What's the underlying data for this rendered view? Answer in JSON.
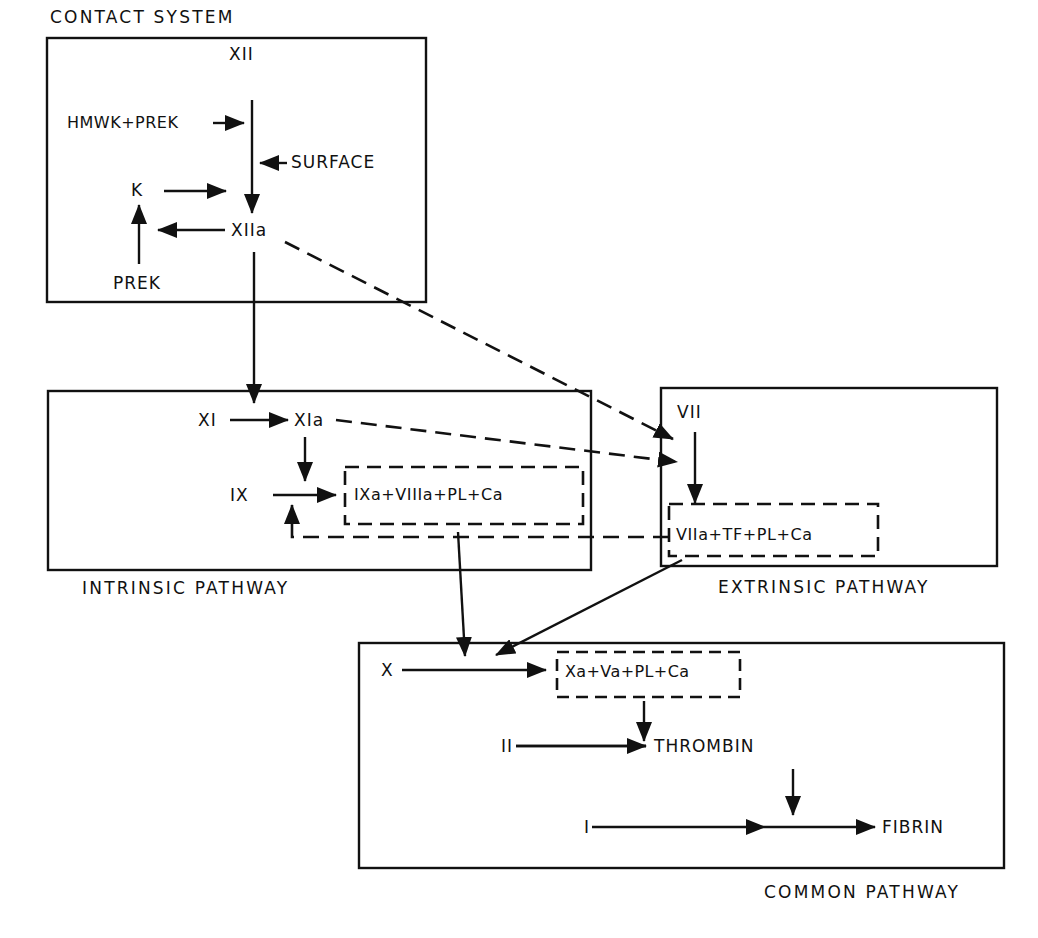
{
  "diagram": {
    "type": "coagulation-cascade",
    "colors": {
      "ink": "#111111",
      "background": "#ffffff"
    },
    "regions": {
      "contact": {
        "title": "CONTACT SYSTEM"
      },
      "intrinsic": {
        "title": "INTRINSIC PATHWAY"
      },
      "extrinsic": {
        "title": "EXTRINSIC PATHWAY"
      },
      "common": {
        "title": "COMMON PATHWAY"
      }
    },
    "nodes": {
      "xii": "XII",
      "hmwk_prek": "HMWK+PREK",
      "surface": "SURFACE",
      "k": "K",
      "xiia": "XIIa",
      "prek": "PREK",
      "xi": "XI",
      "xia": "XIa",
      "ix": "IX",
      "ixa_complex": "IXa+VIIIa+PL+Ca",
      "vii": "VII",
      "viia_complex": "VIIa+TF+PL+Ca",
      "x": "X",
      "xa_complex": "Xa+Va+PL+Ca",
      "ii": "II",
      "thrombin": "THROMBIN",
      "i": "I",
      "fibrin": "FIBRIN"
    },
    "edges": [
      {
        "from": "XII",
        "to": "XIIa",
        "style": "solid"
      },
      {
        "from": "HMWK+PREK",
        "to": "XII→XIIa",
        "style": "solid"
      },
      {
        "from": "SURFACE",
        "to": "XII→XIIa",
        "style": "solid"
      },
      {
        "from": "K",
        "to": "XII→XIIa",
        "style": "solid"
      },
      {
        "from": "XIIa",
        "to": "K",
        "style": "solid"
      },
      {
        "from": "PREK",
        "to": "K",
        "style": "solid"
      },
      {
        "from": "XIIa",
        "to": "XI→XIa",
        "style": "solid"
      },
      {
        "from": "XIIa",
        "to": "VII",
        "style": "dashed"
      },
      {
        "from": "XI",
        "to": "XIa",
        "style": "solid"
      },
      {
        "from": "XIa",
        "to": "VII→VIIa",
        "style": "dashed"
      },
      {
        "from": "XIa",
        "to": "IX→IXa",
        "style": "solid"
      },
      {
        "from": "IX",
        "to": "IXa+VIIIa+PL+Ca",
        "style": "solid"
      },
      {
        "from": "VIIa+TF+PL+Ca",
        "to": "IX",
        "style": "dashed"
      },
      {
        "from": "VII",
        "to": "VIIa+TF+PL+Ca",
        "style": "solid"
      },
      {
        "from": "IXa+VIIIa+PL+Ca",
        "to": "X→Xa",
        "style": "solid"
      },
      {
        "from": "VIIa+TF+PL+Ca",
        "to": "X→Xa",
        "style": "solid"
      },
      {
        "from": "X",
        "to": "Xa+Va+PL+Ca",
        "style": "solid"
      },
      {
        "from": "Xa+Va+PL+Ca",
        "to": "II→THROMBIN",
        "style": "solid"
      },
      {
        "from": "II",
        "to": "THROMBIN",
        "style": "solid"
      },
      {
        "from": "THROMBIN",
        "to": "I→FIBRIN",
        "style": "solid"
      },
      {
        "from": "I",
        "to": "FIBRIN",
        "style": "solid"
      }
    ]
  }
}
